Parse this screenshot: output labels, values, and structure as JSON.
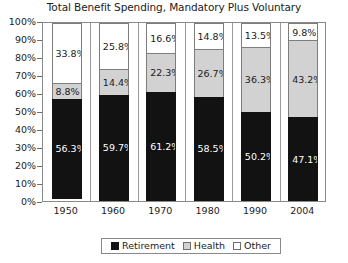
{
  "chart_data": {
    "type": "bar",
    "subtype": "stacked-100-percent",
    "title": "Total Benefit Spending, Mandatory Plus Voluntary",
    "xlabel": "",
    "ylabel": "",
    "ylim": [
      0,
      100
    ],
    "ytick_labels": [
      "0%",
      "10%",
      "20%",
      "30%",
      "40%",
      "50%",
      "60%",
      "70%",
      "80%",
      "90%",
      "100%"
    ],
    "ytick_values": [
      0,
      10,
      20,
      30,
      40,
      50,
      60,
      70,
      80,
      90,
      100
    ],
    "grid": false,
    "vertical_separators": true,
    "legend_position": "bottom",
    "categories": [
      "1950",
      "1960",
      "1970",
      "1980",
      "1990",
      "2004"
    ],
    "series": [
      {
        "name": "Retirement",
        "color": "#121212",
        "values": [
          56.3,
          59.7,
          61.2,
          58.5,
          50.2,
          47.1
        ],
        "labels": [
          "56.3%",
          "59.7%",
          "61.2%",
          "58.5%",
          "50.2%",
          "47.1%"
        ]
      },
      {
        "name": "Health",
        "color": "#d2d2d2",
        "values": [
          8.8,
          14.4,
          22.3,
          26.7,
          36.3,
          43.2
        ],
        "labels": [
          "8.8%",
          "14.4%",
          "22.3%",
          "26.7%",
          "36.3%",
          "43.2%"
        ]
      },
      {
        "name": "Other",
        "color": "#ffffff",
        "values": [
          33.8,
          25.8,
          16.6,
          14.8,
          13.5,
          9.8
        ],
        "labels": [
          "33.8%",
          "25.8%",
          "16.6%",
          "14.8%",
          "13.5%",
          "9.8%"
        ]
      }
    ]
  },
  "legend": {
    "items": [
      {
        "label": "Retirement",
        "swatch": "retirement"
      },
      {
        "label": "Health",
        "swatch": "health"
      },
      {
        "label": "Other",
        "swatch": "other"
      }
    ]
  }
}
